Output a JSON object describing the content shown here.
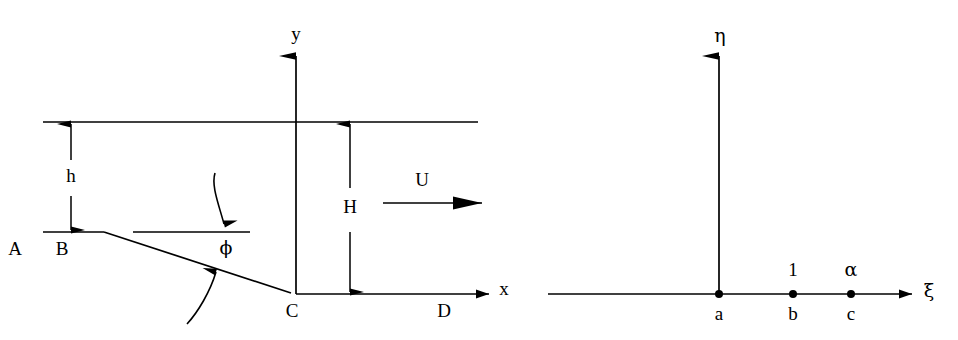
{
  "figure": {
    "background_color": "#ffffff",
    "line_color": "#000000",
    "width": 958,
    "height": 340
  },
  "physical_plane": {
    "name": "z-plane",
    "axis_labels": {
      "x": "x",
      "y": "y"
    },
    "boundary_points": [
      {
        "id": "A",
        "label": "A"
      },
      {
        "id": "B",
        "label": "B"
      },
      {
        "id": "C",
        "label": "C"
      },
      {
        "id": "D",
        "label": "D"
      }
    ],
    "dimensions": [
      {
        "id": "h",
        "label": "h",
        "description": "upstream-to-free-surface depth"
      },
      {
        "id": "H",
        "label": "H",
        "description": "downstream depth at origin"
      }
    ],
    "angle": {
      "id": "phi",
      "label": "ϕ"
    },
    "velocity": {
      "id": "U",
      "label": "U"
    }
  },
  "mapped_plane": {
    "name": "zeta-plane",
    "axis_labels": {
      "xi": "ξ",
      "eta": "η"
    },
    "points": [
      {
        "id": "a",
        "label": "a",
        "value_label": ""
      },
      {
        "id": "b",
        "label": "b",
        "value_label": "1"
      },
      {
        "id": "c",
        "label": "c",
        "value_label": "α"
      }
    ]
  }
}
